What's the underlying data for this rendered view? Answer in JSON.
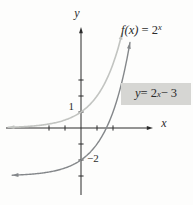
{
  "colors": {
    "axis": "#2b2b2b",
    "text": "#2b2b2b",
    "f_curve": "#c2c4c1",
    "shifted_curve": "#84878a",
    "label_box_bg": "#d6d6d3",
    "background": "#fdfdfc"
  },
  "labels": {
    "f_curve": {
      "fn": "f(x)",
      "eq": " = 2",
      "sup": "x"
    },
    "shifted_curve": {
      "var": "y",
      "eq": " = 2",
      "sup": "x",
      "rest": " − 3"
    }
  },
  "chart_data": {
    "type": "line",
    "xlabel": "x",
    "ylabel": "y",
    "grid": false,
    "axes": {
      "xlabel": "x",
      "ylabel": "y",
      "x_ticks": [
        -2,
        -1,
        1,
        2
      ],
      "y_ticks": [
        3,
        2,
        1,
        -1,
        -2,
        -3
      ],
      "xlim": [
        -4.7,
        4.5
      ],
      "ylim": [
        -4.2,
        6.3
      ]
    },
    "curves": [
      {
        "name": "f(x) = 2^x",
        "base": 2,
        "offset": 0,
        "x_range": [
          -4.55,
          2.565
        ],
        "color": "#c2c4c1",
        "width": 1.6,
        "asymptote_y": 0,
        "arrow_ends": true
      },
      {
        "name": "y = 2^x - 3",
        "base": 2,
        "offset": -3,
        "x_range": [
          -4.3,
          3.06
        ],
        "color": "#84878a",
        "width": 1.4,
        "asymptote_y": -3,
        "arrow_ends": true
      }
    ],
    "key_points": [
      {
        "curve": "f(x) = 2^x",
        "point": [
          0,
          1
        ],
        "label": "1"
      },
      {
        "curve": "y = 2^x - 3",
        "point": [
          0,
          -2
        ],
        "label": "−2"
      }
    ],
    "layout": {
      "origin_px": [
        81,
        128
      ],
      "unit_px": 16,
      "x_axis_span_px": [
        6,
        153
      ],
      "y_axis_span_px": [
        195,
        27
      ],
      "tick_half_px": 2.6
    }
  }
}
